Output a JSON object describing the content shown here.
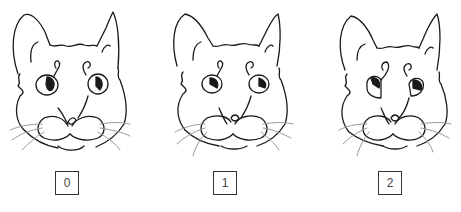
{
  "figure": {
    "panels": [
      {
        "score_label": "0",
        "cat_center_x": 68,
        "box_left": 55,
        "ear_style": "pricked",
        "eye_style": "round"
      },
      {
        "score_label": "1",
        "cat_center_x": 225,
        "box_left": 213,
        "ear_style": "slightly-rotated",
        "eye_style": "half-closed"
      },
      {
        "score_label": "2",
        "cat_center_x": 392,
        "box_left": 378,
        "ear_style": "rotated-outward",
        "eye_style": "squinted"
      }
    ],
    "colors": {
      "line": "#1a1a1a",
      "whisker": "#9a9a9a",
      "box_border": "#333333",
      "label_text": "#444444",
      "background": "#ffffff"
    }
  }
}
